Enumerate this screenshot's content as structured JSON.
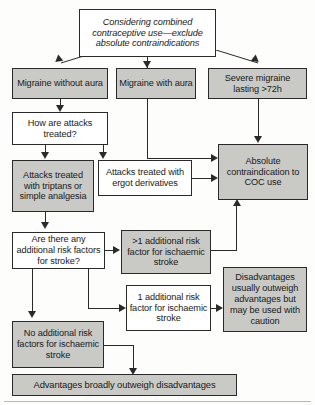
{
  "diagram": {
    "colors": {
      "shaded_box": "#c9c9c6",
      "plain_box": "#ffffff",
      "line": "#2a2a2a",
      "page": "#fdfdfc"
    },
    "nodes": {
      "start": "Considering combined contraceptive use—exclude absolute contraindications",
      "migraine_without_aura": "Migraine without aura",
      "migraine_with_aura": "Migraine with aura",
      "severe_migraine": "Severe migraine lasting >72h",
      "how_treated": "How are attacks treated?",
      "triptans": "Attacks treated with triptans or simple analgesia",
      "ergot": "Attacks treated with ergot derivatives",
      "absolute_contraindication": "Absolute contraindication to COC use",
      "risk_factors_question": "Are there any additional risk factors for stroke?",
      "more_than_one_risk": ">1 additional risk factor for ischaemic stroke",
      "one_risk": "1 additional risk factor for ischaemic stroke",
      "no_risk": "No additional risk factors for ischaemic stroke",
      "disadvantages": "Disadvantages usually outweigh advantages but may be used with caution",
      "advantages": "Advantages broadly outweigh disadvantages"
    }
  }
}
